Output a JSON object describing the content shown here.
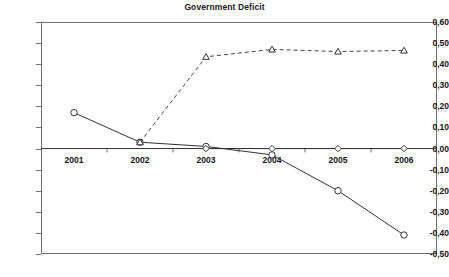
{
  "chart_data": {
    "type": "line",
    "title": "Government Deficit",
    "xlabel": "",
    "ylabel": "",
    "categories": [
      "2001",
      "2002",
      "2003",
      "2004",
      "2005",
      "2006"
    ],
    "ylim": [
      -0.5,
      0.6
    ],
    "ytick_labels": [
      "0,60",
      "0,50",
      "0,40",
      "0,30",
      "0,20",
      "0,10",
      "0,00",
      "-0,10",
      "-0,20",
      "-0,30",
      "-0,40",
      "-0,50"
    ],
    "ytick_values": [
      0.6,
      0.5,
      0.4,
      0.3,
      0.2,
      0.1,
      0.0,
      -0.1,
      -0.2,
      -0.3,
      -0.4,
      -0.5
    ],
    "grid": false,
    "legend_position": "none",
    "decimal_separator": ",",
    "series": [
      {
        "name": "circle-series",
        "marker": "circle",
        "line_style": "solid",
        "color": "#333333",
        "x": [
          "2001",
          "2002",
          "2003",
          "2004",
          "2005",
          "2006"
        ],
        "values": [
          0.17,
          0.03,
          0.01,
          -0.03,
          -0.2,
          -0.41
        ]
      },
      {
        "name": "triangle-series",
        "marker": "triangle",
        "line_style": "dashed",
        "color": "#444444",
        "x": [
          "2002",
          "2003",
          "2004",
          "2005",
          "2006"
        ],
        "values": [
          0.03,
          0.435,
          0.47,
          0.46,
          0.465
        ]
      },
      {
        "name": "diamond-series",
        "marker": "diamond",
        "line_style": "solid",
        "color": "#333333",
        "x": [
          "2003",
          "2004",
          "2005",
          "2006"
        ],
        "values": [
          0.0,
          0.0,
          0.0,
          0.0
        ]
      }
    ]
  }
}
